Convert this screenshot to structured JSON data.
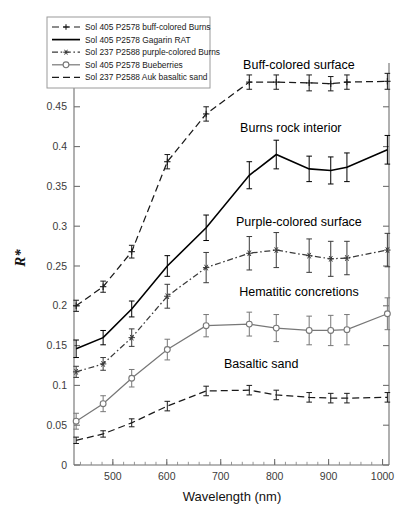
{
  "figure": {
    "xlabel": "Wavelength (nm)",
    "ylabel": "R*",
    "background": "#ffffff",
    "axis_color": "#6f6f6f"
  },
  "legend": {
    "position": "top-left",
    "items": [
      {
        "label": "Sol 405 P2578 buff-colored Burns",
        "style": "dashed-plus",
        "color": "#1a1a1a"
      },
      {
        "label": "Sol 405 P2578 Gagarin RAT",
        "style": "solid",
        "color": "#000000"
      },
      {
        "label": "Sol 237 P2588 purple-colored Burns",
        "style": "dashdot-asterisk",
        "color": "#3a3a3a"
      },
      {
        "label": "Sol 405 P2578 Bueberries",
        "style": "solid-circle",
        "color": "#777777"
      },
      {
        "label": "Sol 237 P2588 Auk basaltic sand",
        "style": "dashed",
        "color": "#1a1a1a"
      }
    ]
  },
  "annotations": [
    {
      "text": "Buff-colored surface",
      "x": 845,
      "y": 0.497
    },
    {
      "text": "Burns rock interior",
      "x": 830,
      "y": 0.418
    },
    {
      "text": "Purple-colored surface",
      "x": 845,
      "y": 0.3
    },
    {
      "text": "Hematitic concretions",
      "x": 845,
      "y": 0.212
    },
    {
      "text": "Basaltic sand",
      "x": 775,
      "y": 0.122
    }
  ],
  "chart_data": {
    "type": "line",
    "title": "",
    "xlabel": "Wavelength (nm)",
    "ylabel": "R*",
    "xlim": [
      428,
      1012
    ],
    "ylim": [
      0,
      0.505
    ],
    "xticks": [
      500,
      600,
      700,
      800,
      900,
      1000
    ],
    "yticks": [
      0,
      0.05,
      0.1,
      0.15,
      0.2,
      0.25,
      0.3,
      0.35,
      0.4,
      0.45
    ],
    "ytick_labels": [
      "0",
      "0.05",
      "0.1",
      "0.15",
      "0.2",
      "0.25",
      "0.3",
      "0.35",
      "0.4",
      "0.45"
    ],
    "xtick_minor_step": 20,
    "grid": false,
    "legend_position": "upper left",
    "series": [
      {
        "name": "Sol 405 P2578 buff-colored Burns",
        "style": "dashed-plus",
        "color": "#1a1a1a",
        "x": [
          432,
          482,
          535,
          601,
          673,
          753,
          803,
          864,
          904,
          934,
          1009
        ],
        "y": [
          0.2,
          0.224,
          0.268,
          0.381,
          0.441,
          0.481,
          0.481,
          0.48,
          0.479,
          0.481,
          0.482
        ],
        "yerr": [
          0.007,
          0.007,
          0.008,
          0.009,
          0.009,
          0.009,
          0.009,
          0.01,
          0.009,
          0.009,
          0.01
        ]
      },
      {
        "name": "Sol 405 P2578 Gagarin RAT",
        "style": "solid",
        "color": "#000000",
        "x": [
          432,
          482,
          535,
          601,
          673,
          753,
          803,
          864,
          904,
          934,
          1009
        ],
        "y": [
          0.146,
          0.16,
          0.196,
          0.25,
          0.298,
          0.364,
          0.39,
          0.372,
          0.37,
          0.374,
          0.396
        ],
        "yerr": [
          0.011,
          0.009,
          0.01,
          0.013,
          0.016,
          0.017,
          0.018,
          0.016,
          0.017,
          0.018,
          0.018
        ]
      },
      {
        "name": "Sol 237 P2588 purple-colored Burns",
        "style": "dashdot-asterisk",
        "color": "#3a3a3a",
        "x": [
          432,
          482,
          535,
          601,
          673,
          753,
          803,
          864,
          904,
          934,
          1009
        ],
        "y": [
          0.117,
          0.127,
          0.16,
          0.212,
          0.248,
          0.266,
          0.27,
          0.263,
          0.259,
          0.26,
          0.27
        ],
        "yerr": [
          0.007,
          0.008,
          0.011,
          0.015,
          0.019,
          0.021,
          0.022,
          0.021,
          0.022,
          0.021,
          0.021
        ]
      },
      {
        "name": "Sol 405 P2578 Bueberries",
        "style": "solid-circle",
        "color": "#777777",
        "x": [
          432,
          482,
          535,
          601,
          673,
          753,
          803,
          864,
          904,
          934,
          1009
        ],
        "y": [
          0.055,
          0.077,
          0.109,
          0.145,
          0.175,
          0.177,
          0.172,
          0.169,
          0.169,
          0.17,
          0.19
        ],
        "yerr": [
          0.01,
          0.01,
          0.011,
          0.013,
          0.014,
          0.015,
          0.017,
          0.018,
          0.019,
          0.019,
          0.02
        ]
      },
      {
        "name": "Sol 237 P2588 Auk basaltic sand",
        "style": "dashed",
        "color": "#1a1a1a",
        "x": [
          432,
          482,
          535,
          601,
          673,
          753,
          803,
          864,
          904,
          934,
          1009
        ],
        "y": [
          0.031,
          0.039,
          0.053,
          0.074,
          0.093,
          0.094,
          0.088,
          0.085,
          0.084,
          0.084,
          0.085
        ],
        "yerr": [
          0.004,
          0.004,
          0.005,
          0.006,
          0.006,
          0.006,
          0.006,
          0.006,
          0.006,
          0.006,
          0.006
        ]
      }
    ]
  }
}
